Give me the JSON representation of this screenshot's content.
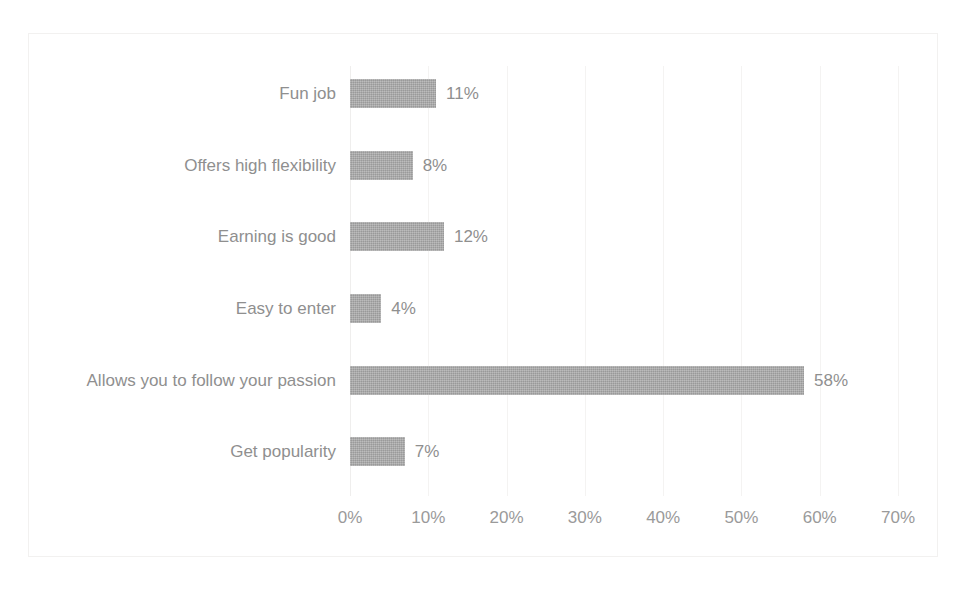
{
  "chart_data": {
    "type": "bar",
    "orientation": "horizontal",
    "title": "",
    "xlabel": "",
    "ylabel": "",
    "categories": [
      "Fun job",
      "Offers high flexibility",
      "Earning is good",
      "Easy to enter",
      "Allows you to follow your passion",
      "Get popularity"
    ],
    "values": [
      11,
      8,
      12,
      4,
      58,
      7
    ],
    "data_labels": [
      "11%",
      "8%",
      "12%",
      "4%",
      "58%",
      "7%"
    ],
    "xlim": [
      0,
      70
    ],
    "xticks": [
      0,
      10,
      20,
      30,
      40,
      50,
      60,
      70
    ],
    "xtick_labels": [
      "0%",
      "10%",
      "20%",
      "30%",
      "40%",
      "50%",
      "60%",
      "70%"
    ],
    "grid": true,
    "grid_axis": "x",
    "legend": false,
    "series": [
      {
        "name": "",
        "values": [
          11,
          8,
          12,
          4,
          58,
          7
        ]
      }
    ]
  },
  "style": {
    "bar_color": "#a9a9a9",
    "text_color": "#8f8f8f",
    "tick_color": "#9a9a9a",
    "gridline_color": "#f4f3f2",
    "frame_color": "#f2f1f0",
    "background": "#ffffff"
  }
}
